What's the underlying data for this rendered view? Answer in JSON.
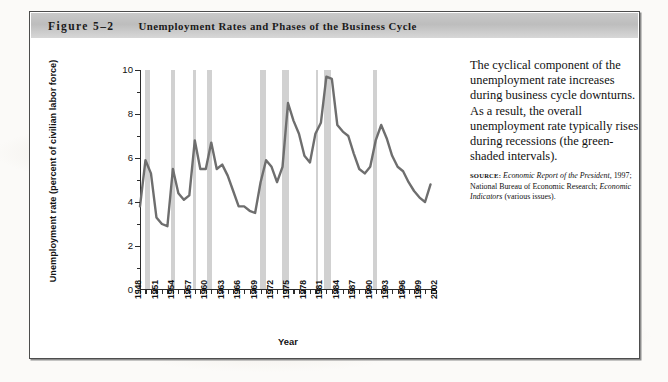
{
  "figure": {
    "number": "Figure 5–2",
    "title": "Unemployment Rates and Phases of the Business Cycle"
  },
  "caption": {
    "text": "The cyclical component of the unemployment rate increases during business cycle downturns. As a result, the overall unemployment rate typically rises during recessions (the green-shaded intervals).",
    "source_label": "SOURCE:",
    "source_italic_1": "Economic Report of the President,",
    "source_rest_1": " 1997;",
    "source_line_2": "National Bureau of Economic Research;",
    "source_italic_2": "Economic Indicators",
    "source_rest_2": " (various issues)."
  },
  "chart_data": {
    "type": "line",
    "title": "Unemployment Rates and Phases of the Business Cycle",
    "xlabel": "Year",
    "ylabel": "Unemployment rate (percent of civilian labor force)",
    "xlim": [
      1948,
      2002
    ],
    "ylim": [
      0,
      10
    ],
    "yticks": [
      0,
      2,
      4,
      6,
      8,
      10
    ],
    "yticks_minor_step": 1,
    "xticks": [
      1948,
      1951,
      1954,
      1957,
      1960,
      1963,
      1966,
      1969,
      1972,
      1975,
      1978,
      1981,
      1984,
      1987,
      1990,
      1993,
      1996,
      1999,
      2002
    ],
    "xticks_minor_step": 1,
    "grid": false,
    "legend": "none",
    "line_color": "#6e6e6e",
    "band_color": "#bfbfbf",
    "band_label": "green-shaded intervals (recessions)",
    "x": [
      1948,
      1949,
      1950,
      1951,
      1952,
      1953,
      1954,
      1955,
      1956,
      1957,
      1958,
      1959,
      1960,
      1961,
      1962,
      1963,
      1964,
      1965,
      1966,
      1967,
      1968,
      1969,
      1970,
      1971,
      1972,
      1973,
      1974,
      1975,
      1976,
      1977,
      1978,
      1979,
      1980,
      1981,
      1982,
      1983,
      1984,
      1985,
      1986,
      1987,
      1988,
      1989,
      1990,
      1991,
      1992,
      1993,
      1994,
      1995,
      1996,
      1997,
      1998,
      1999,
      2000,
      2001
    ],
    "values": [
      3.8,
      5.9,
      5.3,
      3.3,
      3.0,
      2.9,
      5.5,
      4.4,
      4.1,
      4.3,
      6.8,
      5.5,
      5.5,
      6.7,
      5.5,
      5.7,
      5.2,
      4.5,
      3.8,
      3.8,
      3.6,
      3.5,
      4.9,
      5.9,
      5.6,
      4.9,
      5.6,
      8.5,
      7.7,
      7.1,
      6.1,
      5.8,
      7.1,
      7.6,
      9.7,
      9.6,
      7.5,
      7.2,
      7.0,
      6.2,
      5.5,
      5.3,
      5.6,
      6.8,
      7.5,
      6.9,
      6.1,
      5.6,
      5.4,
      4.9,
      4.5,
      4.2,
      4.0,
      4.8
    ],
    "recessions": [
      {
        "start": 1948.9,
        "end": 1949.8
      },
      {
        "start": 1953.6,
        "end": 1954.4
      },
      {
        "start": 1957.6,
        "end": 1958.3
      },
      {
        "start": 1960.3,
        "end": 1961.1
      },
      {
        "start": 1969.9,
        "end": 1970.9
      },
      {
        "start": 1973.9,
        "end": 1975.2
      },
      {
        "start": 1980.1,
        "end": 1980.5
      },
      {
        "start": 1981.5,
        "end": 1982.9
      },
      {
        "start": 1990.5,
        "end": 1991.2
      }
    ]
  }
}
